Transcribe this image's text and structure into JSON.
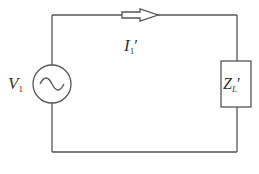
{
  "diagram": {
    "type": "circuit",
    "colors": {
      "wire": "#555555",
      "background": "#ffffff",
      "text": "#333333"
    },
    "source": {
      "symbol": "V",
      "subscript": "1",
      "label": "V1",
      "kind": "ac-voltage-source"
    },
    "current": {
      "symbol": "I",
      "subscript": "1",
      "prime": "′",
      "label": "I1′",
      "direction": "clockwise"
    },
    "load": {
      "symbol": "Z",
      "subscript": "L",
      "prime": "′",
      "label": "ZL′",
      "kind": "impedance"
    }
  }
}
